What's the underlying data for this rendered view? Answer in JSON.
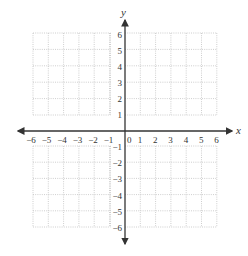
{
  "chart_data": {
    "type": "coordinate-grid",
    "title": "",
    "xlabel": "x",
    "ylabel": "y",
    "xlim": [
      -6,
      6
    ],
    "ylim": [
      -6,
      6
    ],
    "grid": true,
    "grid_style": "dotted",
    "x_ticks": [
      "-6",
      "-5",
      "-4",
      "-3",
      "-2",
      "-1",
      "0",
      "1",
      "2",
      "3",
      "4",
      "5",
      "6"
    ],
    "y_ticks": [
      "6",
      "5",
      "4",
      "3",
      "2",
      "1",
      "-1",
      "-2",
      "-3",
      "-4",
      "-5",
      "-6"
    ],
    "origin_label": "0",
    "series": []
  },
  "axes": {
    "x_label": "x",
    "y_label": "y",
    "origin_label": "0",
    "x_neg_ticks": [
      "−6",
      "−5",
      "−4",
      "−3",
      "−2",
      "−1"
    ],
    "x_pos_ticks": [
      "1",
      "2",
      "3",
      "4",
      "5",
      "6"
    ],
    "y_pos_ticks": [
      "6",
      "5",
      "4",
      "3",
      "2",
      "1"
    ],
    "y_neg_ticks": [
      "−1",
      "−2",
      "−3",
      "−4",
      "−5",
      "−6"
    ]
  },
  "colors": {
    "axis": "#333333",
    "grid": "#bdbdbd",
    "label": "#333333"
  }
}
